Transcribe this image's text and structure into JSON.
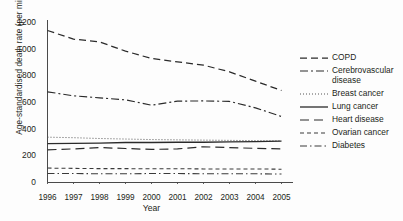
{
  "chart_data": {
    "type": "line",
    "title": "",
    "xlabel": "Year",
    "ylabel": "Age-standardised death rate (per million)",
    "x": [
      1996,
      1997,
      1998,
      1999,
      2000,
      2001,
      2002,
      2003,
      2004,
      2005
    ],
    "xtick_labels": [
      "1996",
      "1997",
      "1998",
      "1999",
      "2000",
      "2001",
      "2002",
      "2003",
      "2004",
      "2005"
    ],
    "ytick_labels": [
      "0",
      "200",
      "400",
      "600",
      "800",
      "1000",
      "1200"
    ],
    "ytick_values": [
      0,
      200,
      400,
      600,
      800,
      1000,
      1200
    ],
    "xlim": [
      1996,
      2005
    ],
    "ylim": [
      0,
      1200
    ],
    "grid": false,
    "legend_position": "right",
    "series": [
      {
        "name": "COPD",
        "legend_label": "COPD",
        "dash": "7,4",
        "width": 1.25,
        "color": "#2b2b2b",
        "values": [
          1140,
          1075,
          1055,
          985,
          930,
          905,
          880,
          830,
          760,
          690
        ]
      },
      {
        "name": "Cerebrovascular disease",
        "legend_label": "Cerebrovascular disease",
        "dash": "8,3,2,3",
        "width": 1.15,
        "color": "#2b2b2b",
        "values": [
          680,
          650,
          635,
          620,
          580,
          610,
          612,
          608,
          560,
          495
        ]
      },
      {
        "name": "Breast cancer",
        "legend_label": "Breast cancer",
        "dash": "1,2",
        "width": 1.0,
        "color": "#555555",
        "values": [
          340,
          336,
          330,
          326,
          322,
          320,
          318,
          316,
          314,
          312
        ]
      },
      {
        "name": "Lung cancer",
        "legend_label": "Lung cancer",
        "dash": "none",
        "width": 1.3,
        "color": "#2b2b2b",
        "values": [
          292,
          294,
          296,
          300,
          300,
          302,
          302,
          304,
          306,
          310
        ]
      },
      {
        "name": "Heart disease",
        "legend_label": "Heart disease",
        "dash": "9,5",
        "width": 1.2,
        "color": "#2b2b2b",
        "values": [
          245,
          252,
          262,
          255,
          248,
          252,
          268,
          262,
          256,
          252
        ]
      },
      {
        "name": "Ovarian cancer",
        "legend_label": "Ovarian cancer",
        "dash": "4,3",
        "width": 1.05,
        "color": "#3a3a3a",
        "values": [
          108,
          106,
          104,
          104,
          103,
          103,
          102,
          102,
          101,
          100
        ]
      },
      {
        "name": "Diabetes",
        "legend_label": "Diabetes",
        "dash": "7,3,1.5,3",
        "width": 1.05,
        "color": "#3a3a3a",
        "values": [
          68,
          67,
          66,
          66,
          67,
          67,
          66,
          66,
          65,
          64
        ]
      }
    ]
  },
  "legend": {
    "items": [
      {
        "label": "COPD"
      },
      {
        "label": "Cerebrovascular\ndisease"
      },
      {
        "label": "Breast cancer"
      },
      {
        "label": "Lung cancer"
      },
      {
        "label": "Heart disease"
      },
      {
        "label": "Ovarian cancer"
      },
      {
        "label": "Diabetes"
      }
    ]
  },
  "axes": {
    "x_title": "Year",
    "y_title": "Age-standardised death rate (per million)"
  }
}
